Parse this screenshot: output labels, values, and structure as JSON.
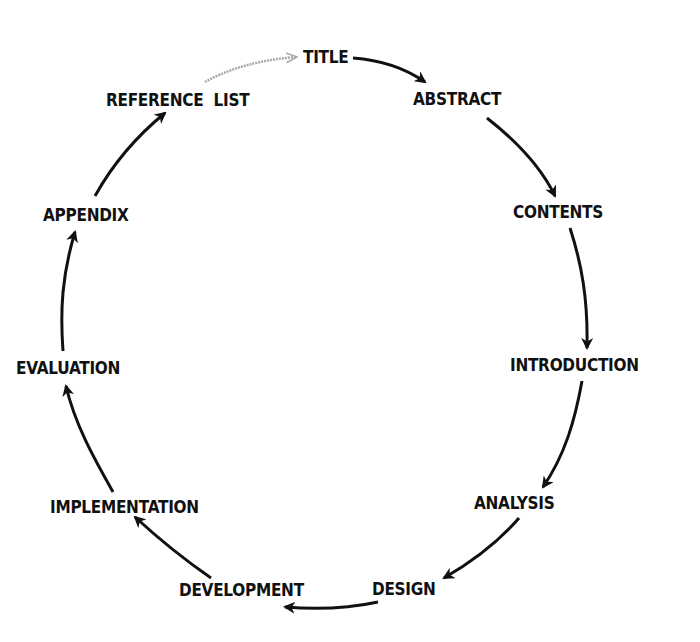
{
  "diagram": {
    "type": "cycle",
    "nodes": [
      {
        "id": "title",
        "label": "TITLE",
        "x": 303,
        "y": 47
      },
      {
        "id": "abstract",
        "label": "ABSTRACT",
        "x": 413,
        "y": 89
      },
      {
        "id": "contents",
        "label": "CONTENTS",
        "x": 513,
        "y": 202
      },
      {
        "id": "introduction",
        "label": "INTRODUCTION",
        "x": 510,
        "y": 355
      },
      {
        "id": "analysis",
        "label": "ANALYSIS",
        "x": 474,
        "y": 493
      },
      {
        "id": "design",
        "label": "DESIGN",
        "x": 372,
        "y": 579
      },
      {
        "id": "development",
        "label": "DEVELOPMENT",
        "x": 179,
        "y": 580
      },
      {
        "id": "implementation",
        "label": "IMPLEMENTATION",
        "x": 50,
        "y": 497
      },
      {
        "id": "evaluation",
        "label": "EVALUATION",
        "x": 16,
        "y": 358
      },
      {
        "id": "appendix",
        "label": "APPENDIX",
        "x": 43,
        "y": 205
      },
      {
        "id": "reference_list",
        "label": "REFERENCE  LIST",
        "x": 106,
        "y": 90
      }
    ],
    "edges": [
      {
        "from": "title",
        "to": "abstract",
        "style": "solid",
        "color": "#111111"
      },
      {
        "from": "abstract",
        "to": "contents",
        "style": "solid",
        "color": "#111111"
      },
      {
        "from": "contents",
        "to": "introduction",
        "style": "solid",
        "color": "#111111"
      },
      {
        "from": "introduction",
        "to": "analysis",
        "style": "solid",
        "color": "#111111"
      },
      {
        "from": "analysis",
        "to": "design",
        "style": "solid",
        "color": "#111111"
      },
      {
        "from": "design",
        "to": "development",
        "style": "solid",
        "color": "#111111"
      },
      {
        "from": "development",
        "to": "implementation",
        "style": "solid",
        "color": "#111111"
      },
      {
        "from": "implementation",
        "to": "evaluation",
        "style": "solid",
        "color": "#111111"
      },
      {
        "from": "evaluation",
        "to": "appendix",
        "style": "solid",
        "color": "#111111"
      },
      {
        "from": "appendix",
        "to": "reference_list",
        "style": "solid",
        "color": "#111111"
      },
      {
        "from": "reference_list",
        "to": "title",
        "style": "faded",
        "color": "#a8a8a8"
      }
    ]
  }
}
